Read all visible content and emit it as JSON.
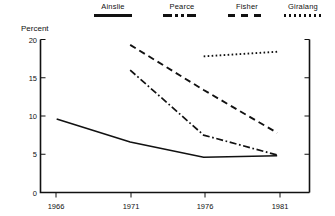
{
  "chart_data": {
    "type": "line",
    "title": "",
    "xlabel": "",
    "ylabel": "Percent",
    "x": [
      1966,
      1971,
      1976,
      1981
    ],
    "xtick_labels": [
      "1966",
      "1971",
      "1976",
      "1981"
    ],
    "ytick_labels": [
      "0",
      "5",
      "10",
      "15",
      "20"
    ],
    "yticks": [
      0,
      5,
      10,
      15,
      20
    ],
    "ylim": [
      0,
      20
    ],
    "xlim": [
      1964.9,
      1983.2
    ],
    "grid": false,
    "legend_position": "top",
    "series": [
      {
        "name": "Ainslie",
        "style": "solid",
        "x": [
          1966,
          1971,
          1976,
          1981
        ],
        "values": [
          9.6,
          6.6,
          4.6,
          4.8
        ]
      },
      {
        "name": "Pearce",
        "style": "dash-dot",
        "x": [
          1971,
          1976,
          1981
        ],
        "values": [
          16.0,
          7.5,
          4.9
        ]
      },
      {
        "name": "Fisher",
        "style": "dashed",
        "x": [
          1971,
          1976,
          1981
        ],
        "values": [
          19.3,
          13.4,
          7.8
        ]
      },
      {
        "name": "Giralang",
        "style": "dotted",
        "x": [
          1976,
          1981
        ],
        "values": [
          17.8,
          18.4
        ]
      }
    ],
    "colors": {
      "line": "#111111",
      "axis": "#111111",
      "background": "#ffffff"
    }
  },
  "legend": {
    "items": [
      {
        "label": "Ainslie",
        "style": "solid"
      },
      {
        "label": "Pearce",
        "style": "dash-dot"
      },
      {
        "label": "Fisher",
        "style": "dashed"
      },
      {
        "label": "Giralang",
        "style": "dotted"
      }
    ]
  },
  "axes": {
    "ylabel": "Percent",
    "ytick_labels": [
      "20",
      "15",
      "10",
      "5",
      "0"
    ],
    "xtick_labels": [
      "1966",
      "1971",
      "1976",
      "1981"
    ]
  }
}
